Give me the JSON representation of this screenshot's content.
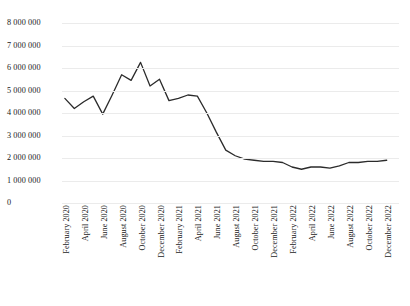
{
  "chart_data": {
    "type": "line",
    "title": "",
    "subtitle": "",
    "xlabel": "",
    "ylabel": "",
    "grid": true,
    "legend": false,
    "legend_position": "none",
    "line_color": "#2b2b2b",
    "grid_color": "#ebebeb",
    "text_color": "#1a1a1a",
    "ylim": [
      0,
      8000000
    ],
    "ytick_values": [
      8000000,
      7000000,
      6000000,
      5000000,
      4000000,
      3000000,
      2000000,
      1000000,
      0
    ],
    "ytick_labels": [
      "8 000 000",
      "7 000 000",
      "6 000 000",
      "5 000 000",
      "4 000 000",
      "3 000 000",
      "2 000 000",
      "1 000 000",
      "0"
    ],
    "xtick_labels": [
      "February 2020",
      "April 2020",
      "June 2020",
      "August 2020",
      "October 2020",
      "December 2020",
      "February 2021",
      "April 2021",
      "June 2021",
      "August 2021",
      "October 2021",
      "December 2021",
      "February 2022",
      "April 2022",
      "June 2022",
      "August 2022",
      "October 2022",
      "December 2022"
    ],
    "x": [
      "February 2020",
      "March 2020",
      "April 2020",
      "May 2020",
      "June 2020",
      "July 2020",
      "August 2020",
      "September 2020",
      "October 2020",
      "November 2020",
      "December 2020",
      "January 2021",
      "February 2021",
      "March 2021",
      "April 2021",
      "May 2021",
      "June 2021",
      "July 2021",
      "August 2021",
      "September 2021",
      "October 2021",
      "November 2021",
      "December 2021",
      "January 2022",
      "February 2022",
      "March 2022",
      "April 2022",
      "May 2022",
      "June 2022",
      "July 2022",
      "August 2022",
      "September 2022",
      "October 2022",
      "November 2022",
      "December 2022"
    ],
    "values": [
      4650000,
      4200000,
      4500000,
      4750000,
      3950000,
      4800000,
      5700000,
      5450000,
      6250000,
      5200000,
      5500000,
      4550000,
      4650000,
      4800000,
      4750000,
      4000000,
      3150000,
      2350000,
      2100000,
      1950000,
      1900000,
      1850000,
      1850000,
      1800000,
      1600000,
      1500000,
      1600000,
      1600000,
      1550000,
      1650000,
      1800000,
      1800000,
      1850000,
      1850000,
      1900000
    ]
  }
}
